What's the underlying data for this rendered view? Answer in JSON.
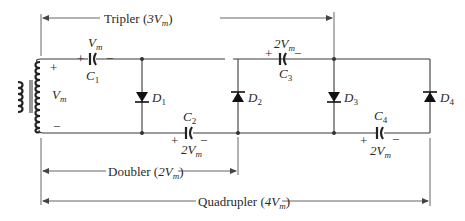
{
  "diagram": {
    "dimension_labels": {
      "tripler": {
        "name": "Tripler",
        "value": "3V",
        "sub": "m"
      },
      "doubler": {
        "name": "Doubler",
        "value": "2V",
        "sub": "m"
      },
      "quadrupler": {
        "name": "Quadrupler",
        "value": "4V",
        "sub": "m"
      }
    },
    "source": {
      "label": "V",
      "sub": "m",
      "plus": "+",
      "minus": "−"
    },
    "capacitors": [
      {
        "id": "C",
        "num": "1",
        "voltage": "V",
        "vsub": "m",
        "plus": "+",
        "minus": "−"
      },
      {
        "id": "C",
        "num": "2",
        "voltage": "2V",
        "vsub": "m",
        "plus": "+",
        "minus": "−"
      },
      {
        "id": "C",
        "num": "3",
        "voltage": "2V",
        "vsub": "m",
        "plus": "+",
        "minus": "−"
      },
      {
        "id": "C",
        "num": "4",
        "voltage": "2V",
        "vsub": "m",
        "plus": "+",
        "minus": "−"
      }
    ],
    "diodes": [
      {
        "id": "D",
        "num": "1",
        "direction": "down"
      },
      {
        "id": "D",
        "num": "2",
        "direction": "up"
      },
      {
        "id": "D",
        "num": "3",
        "direction": "down"
      },
      {
        "id": "D",
        "num": "4",
        "direction": "up"
      }
    ]
  }
}
